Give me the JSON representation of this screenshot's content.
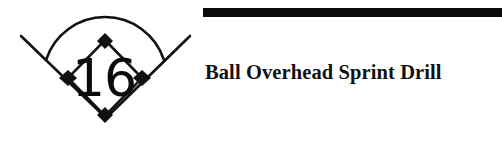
{
  "page": {
    "background_color": "#ffffff",
    "width": 502,
    "height": 141
  },
  "header_rule": {
    "color": "#0a0a0a"
  },
  "logo": {
    "name": "baseball-diamond-logo",
    "number": "16",
    "stroke_color": "#111111",
    "fill_color": "#111111",
    "parts": {
      "outfield_arc": "outfield-fence-arc",
      "left_foul_line": "left-foul-line",
      "right_foul_line": "right-foul-line",
      "infield_diamond": "infield-diamond",
      "bases": [
        "second-base",
        "third-base",
        "first-base",
        "home-plate"
      ]
    }
  },
  "title": {
    "text": "Ball Overhead Sprint Drill",
    "color": "#111111"
  }
}
